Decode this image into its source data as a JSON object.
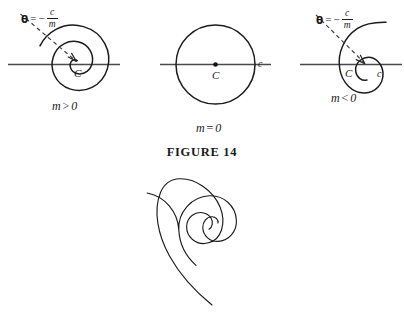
{
  "figure": {
    "caption": "FIGURE 14",
    "background_color": "#ffffff",
    "stroke_color": "#1c1c1c",
    "axis_color": "#4a4a4a"
  },
  "panels": [
    {
      "id": "panel-left",
      "condition": "m > 0",
      "condition_symbol": "m",
      "condition_operator": ">",
      "condition_value": "0",
      "theta_equation": {
        "theta": "θ",
        "equals": "=",
        "minus": "−",
        "numerator": "c",
        "denominator": "m"
      },
      "center_label": "C",
      "has_dashed_asymptote": true,
      "has_arrowhead": true,
      "spiral_direction": "outward-counterclockwise"
    },
    {
      "id": "panel-middle",
      "condition": "m = 0",
      "condition_symbol": "m",
      "condition_operator": "=",
      "condition_value": "0",
      "center_label": "C",
      "radius_label": "c",
      "has_dashed_asymptote": false,
      "has_center_dot": true,
      "shape": "circle"
    },
    {
      "id": "panel-right",
      "condition": "m < 0",
      "condition_symbol": "m",
      "condition_operator": "<",
      "condition_value": "0",
      "theta_equation": {
        "theta": "θ",
        "equals": "=",
        "minus": "−",
        "numerator": "c",
        "denominator": "m"
      },
      "center_label": "C",
      "radius_label": "c",
      "has_dashed_asymptote": true,
      "has_arrowhead": true,
      "spiral_direction": "inward-clockwise"
    }
  ],
  "bottom_figure": {
    "id": "logarithmic-spiral",
    "description": "logarithmic spiral"
  }
}
